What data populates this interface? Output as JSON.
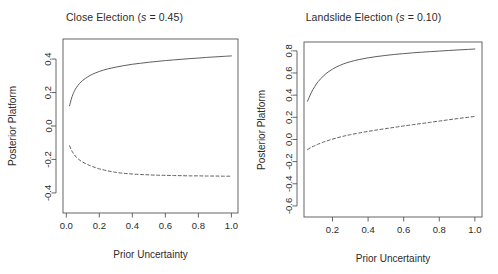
{
  "figure": {
    "background": "#ffffff",
    "line_color": "#555555",
    "axis_color": "#555555",
    "text_color": "#2b2b2b"
  },
  "panels": [
    {
      "id": "close-election",
      "title_main": "Close Election (",
      "title_italic": "s",
      "title_tail": " = 0.45)",
      "title_full": "Close Election (s = 0.45)",
      "xlabel": "Prior Uncertainty",
      "ylabel": "Posterior Platform",
      "xticks": [
        "0.0",
        "0.2",
        "0.4",
        "0.6",
        "0.8",
        "1.0"
      ],
      "xtick_values": [
        0.0,
        0.2,
        0.4,
        0.6,
        0.8,
        1.0
      ],
      "yticks": [
        "-0.4",
        "-0.2",
        "0.0",
        "0.2",
        "0.4"
      ],
      "ytick_values": [
        -0.4,
        -0.2,
        0.0,
        0.2,
        0.4
      ]
    },
    {
      "id": "landslide-election",
      "title_main": "Landslide Election (",
      "title_italic": "s",
      "title_tail": " = 0.10)",
      "title_full": "Landslide Election (s = 0.10)",
      "xlabel": "Prior Uncertainty",
      "ylabel": "Posterior Platform",
      "xticks": [
        "0.2",
        "0.4",
        "0.6",
        "0.8",
        "1.0"
      ],
      "xtick_values": [
        0.2,
        0.4,
        0.6,
        0.8,
        1.0
      ],
      "yticks": [
        "-0.6",
        "-0.4",
        "-0.2",
        "0.0",
        "0.2",
        "0.4",
        "0.6",
        "0.8"
      ],
      "ytick_values": [
        -0.6,
        -0.4,
        -0.2,
        0.0,
        0.2,
        0.4,
        0.6,
        0.8
      ]
    }
  ],
  "chart_data": [
    {
      "type": "line",
      "title": "Close Election (s = 0.45)",
      "xlabel": "Prior Uncertainty",
      "ylabel": "Posterior Platform",
      "xlim": [
        -0.02,
        1.04
      ],
      "ylim": [
        -0.52,
        0.52
      ],
      "grid": false,
      "legend": "none",
      "xticks": [
        0.0,
        0.2,
        0.4,
        0.6,
        0.8,
        1.0
      ],
      "yticks": [
        -0.4,
        -0.2,
        0.0,
        0.2,
        0.4
      ],
      "series": [
        {
          "name": "upper-platform",
          "style": "solid",
          "x": [
            0.02,
            0.03,
            0.04,
            0.05,
            0.06,
            0.08,
            0.1,
            0.13,
            0.16,
            0.2,
            0.25,
            0.3,
            0.35,
            0.4,
            0.45,
            0.5,
            0.55,
            0.6,
            0.65,
            0.7,
            0.75,
            0.8,
            0.85,
            0.9,
            0.95,
            1.0
          ],
          "y": [
            0.121,
            0.16,
            0.189,
            0.211,
            0.228,
            0.254,
            0.273,
            0.294,
            0.31,
            0.326,
            0.341,
            0.352,
            0.361,
            0.369,
            0.375,
            0.381,
            0.386,
            0.391,
            0.395,
            0.399,
            0.403,
            0.406,
            0.41,
            0.413,
            0.416,
            0.419
          ]
        },
        {
          "name": "lower-platform",
          "style": "dashed",
          "x": [
            0.02,
            0.03,
            0.04,
            0.05,
            0.06,
            0.08,
            0.1,
            0.13,
            0.16,
            0.2,
            0.25,
            0.3,
            0.35,
            0.4,
            0.45,
            0.5,
            0.55,
            0.6,
            0.65,
            0.7,
            0.75,
            0.8,
            0.85,
            0.9,
            0.95,
            1.0
          ],
          "y": [
            -0.118,
            -0.142,
            -0.16,
            -0.174,
            -0.186,
            -0.203,
            -0.216,
            -0.231,
            -0.243,
            -0.256,
            -0.268,
            -0.277,
            -0.283,
            -0.287,
            -0.29,
            -0.292,
            -0.294,
            -0.295,
            -0.296,
            -0.297,
            -0.298,
            -0.298,
            -0.299,
            -0.299,
            -0.3,
            -0.3
          ]
        }
      ]
    },
    {
      "type": "line",
      "title": "Landslide Election (s = 0.10)",
      "xlabel": "Prior Uncertainty",
      "ylabel": "Posterior Platform",
      "xlim": [
        0.04,
        1.04
      ],
      "ylim": [
        -0.7,
        0.88
      ],
      "grid": false,
      "legend": "none",
      "xticks": [
        0.2,
        0.4,
        0.6,
        0.8,
        1.0
      ],
      "yticks": [
        -0.6,
        -0.4,
        -0.2,
        0.0,
        0.2,
        0.4,
        0.6,
        0.8
      ],
      "series": [
        {
          "name": "upper-platform",
          "style": "solid",
          "x": [
            0.06,
            0.08,
            0.1,
            0.12,
            0.15,
            0.18,
            0.22,
            0.26,
            0.3,
            0.35,
            0.4,
            0.45,
            0.5,
            0.55,
            0.6,
            0.65,
            0.7,
            0.75,
            0.8,
            0.85,
            0.9,
            0.95,
            1.0
          ],
          "y": [
            0.345,
            0.42,
            0.477,
            0.523,
            0.575,
            0.614,
            0.653,
            0.681,
            0.702,
            0.722,
            0.737,
            0.749,
            0.759,
            0.768,
            0.775,
            0.782,
            0.788,
            0.793,
            0.798,
            0.803,
            0.808,
            0.812,
            0.817
          ]
        },
        {
          "name": "lower-platform",
          "style": "dashed",
          "x": [
            0.06,
            0.08,
            0.1,
            0.12,
            0.15,
            0.18,
            0.22,
            0.26,
            0.3,
            0.35,
            0.4,
            0.45,
            0.5,
            0.55,
            0.6,
            0.65,
            0.7,
            0.75,
            0.8,
            0.85,
            0.9,
            0.95,
            1.0
          ],
          "y": [
            -0.09,
            -0.072,
            -0.056,
            -0.042,
            -0.023,
            -0.007,
            0.012,
            0.029,
            0.043,
            0.059,
            0.073,
            0.086,
            0.098,
            0.11,
            0.122,
            0.133,
            0.144,
            0.155,
            0.166,
            0.177,
            0.188,
            0.198,
            0.208
          ]
        }
      ]
    }
  ]
}
